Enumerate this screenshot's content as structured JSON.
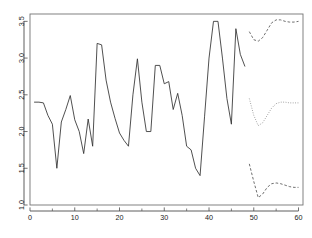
{
  "chart_data": {
    "type": "line",
    "title": "",
    "subtitle": "",
    "xlabel": "",
    "ylabel": "",
    "xlim": [
      0,
      61
    ],
    "ylim": [
      1.0,
      3.6
    ],
    "grid": false,
    "legend": "none",
    "x_ticks": [
      0,
      10,
      20,
      30,
      40,
      50,
      60
    ],
    "x_tick_labels": [
      "0",
      "10",
      "20",
      "30",
      "40",
      "50",
      "60"
    ],
    "x_minor_ticks": [
      5,
      15,
      25,
      35,
      45,
      55
    ],
    "y_ticks": [
      1.0,
      1.5,
      2.0,
      2.5,
      3.0,
      3.5
    ],
    "y_tick_labels": [
      "1.0",
      "1.5",
      "2.0",
      "2.5",
      "3.0",
      "3.5"
    ],
    "series": [
      {
        "name": "observed",
        "style": "solid",
        "color": "#303030",
        "x": [
          1,
          2,
          3,
          4,
          5,
          6,
          7,
          8,
          9,
          10,
          11,
          12,
          13,
          14,
          15,
          16,
          17,
          18,
          19,
          20,
          21,
          22,
          23,
          24,
          25,
          26,
          27,
          28,
          29,
          30,
          31,
          32,
          33,
          34,
          35,
          36,
          37,
          38,
          39,
          40,
          41,
          42,
          43,
          44,
          45,
          46,
          47,
          48
        ],
        "values": [
          2.4,
          2.4,
          2.39,
          2.22,
          2.1,
          1.5,
          2.13,
          2.3,
          2.49,
          2.16,
          2.0,
          1.7,
          2.17,
          1.8,
          3.2,
          3.18,
          2.7,
          2.4,
          2.18,
          1.98,
          1.88,
          1.8,
          2.5,
          2.99,
          2.4,
          2.0,
          2.0,
          2.9,
          2.9,
          2.65,
          2.68,
          2.3,
          2.52,
          2.22,
          1.8,
          1.75,
          1.5,
          1.4,
          2.2,
          3.0,
          3.5,
          3.5,
          3.0,
          2.45,
          2.1,
          3.4,
          3.05,
          2.89
        ]
      },
      {
        "name": "forecast-upper",
        "style": "dashed",
        "color": "#555555",
        "x": [
          49,
          50,
          51,
          52,
          53,
          54,
          55,
          56,
          57,
          58,
          59,
          60
        ],
        "values": [
          3.36,
          3.25,
          3.23,
          3.28,
          3.38,
          3.48,
          3.52,
          3.52,
          3.5,
          3.49,
          3.49,
          3.5
        ]
      },
      {
        "name": "forecast-mean",
        "style": "dotted",
        "color": "#8a8a8a",
        "x": [
          49,
          50,
          51,
          52,
          53,
          54,
          55,
          56,
          57,
          58,
          59,
          60
        ],
        "values": [
          2.45,
          2.22,
          2.08,
          2.12,
          2.22,
          2.32,
          2.38,
          2.4,
          2.4,
          2.39,
          2.39,
          2.39
        ]
      },
      {
        "name": "forecast-lower",
        "style": "dashed",
        "color": "#555555",
        "x": [
          49,
          50,
          51,
          52,
          53,
          54,
          55,
          56,
          57,
          58,
          59,
          60
        ],
        "values": [
          1.56,
          1.32,
          1.1,
          1.15,
          1.24,
          1.29,
          1.3,
          1.29,
          1.27,
          1.25,
          1.24,
          1.24
        ]
      }
    ]
  },
  "plot": {
    "box_left": 30,
    "box_top": 14,
    "box_right": 303,
    "box_bottom": 205
  }
}
